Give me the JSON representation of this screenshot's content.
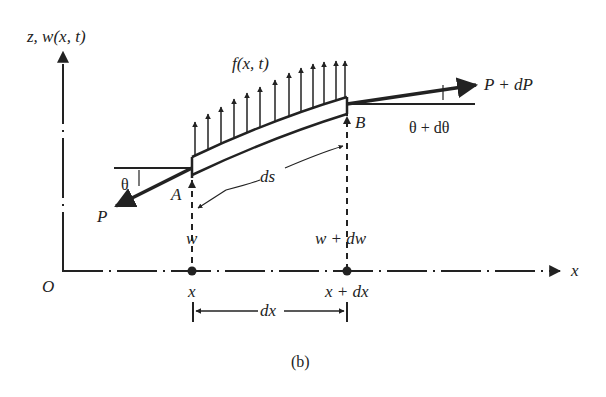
{
  "figure": {
    "caption": "(b)",
    "labels": {
      "z_axis": "z, w(x, t)",
      "x_axis": "x",
      "origin": "O",
      "load": "f(x, t)",
      "force_left": "P",
      "force_right": "P + dP",
      "angle_left": "θ",
      "angle_right": "θ + dθ",
      "point_a": "A",
      "point_b": "B",
      "arc_length": "ds",
      "deflection_left": "w",
      "deflection_right": "w + dw",
      "x_left": "x",
      "x_right": "x + dx",
      "dx": "dx"
    },
    "colors": {
      "ink": "#222222",
      "background": "#ffffff"
    }
  }
}
